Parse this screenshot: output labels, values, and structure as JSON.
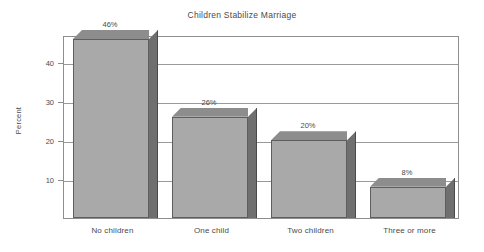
{
  "chart_data": {
    "type": "bar",
    "title": "Children Stabilize Marriage",
    "xlabel": "",
    "ylabel": "Percent",
    "categories": [
      "No children",
      "One child",
      "Two children",
      "Three or more"
    ],
    "values": [
      46,
      26,
      20,
      8
    ],
    "data_labels": [
      "46%",
      "26%",
      "20%",
      "8%"
    ],
    "ylim": [
      0,
      47
    ],
    "yticks": [
      10,
      20,
      30,
      40
    ],
    "ytick_labels": [
      "10",
      "20",
      "30",
      "40"
    ],
    "grid": true,
    "legend": "none",
    "style": "3d-bar",
    "colors": {
      "bar_front": "#a9a9a9",
      "bar_side": "#6f6f6f",
      "bar_top": "#8d8d8d",
      "bar_outline": "#5e5e5e",
      "axis": "#8e8e8e",
      "gridline": "#9a9a9a",
      "text": "#4a4a4a",
      "background": "#ffffff"
    }
  }
}
